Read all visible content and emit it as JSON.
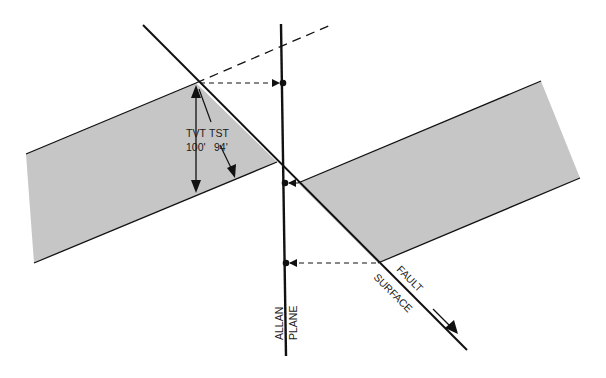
{
  "diagram": {
    "type": "geologic cross-section",
    "colors": {
      "bed_fill": "#c6c6c6",
      "line": "#111111",
      "background": "#ffffff"
    },
    "labels": {
      "tvt_label": "TVT",
      "tvt_value": "100'",
      "tst_label": "TST",
      "tst_value": "94'",
      "fault_word1": "FAULT",
      "fault_word2": "SURFACE",
      "allan_word1": "ALLAN",
      "allan_word2": "PLANE"
    },
    "elements": [
      "fault-surface-line",
      "allan-plane-line",
      "footwall-bed",
      "hanging-wall-bed",
      "projected-bed-top-dashed",
      "projection-arrows",
      "tvt-measure-arrow",
      "tst-measure-arrow",
      "slip-direction-arrow"
    ]
  }
}
